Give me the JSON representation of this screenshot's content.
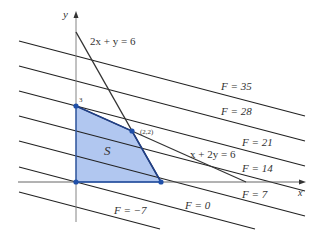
{
  "diagram": {
    "type": "linear-programming-feasible-region",
    "axes": {
      "x_label": "x",
      "y_label": "y",
      "y_intercept_label": "3"
    },
    "constraints": [
      {
        "id": "c1",
        "label": "2x + y = 6"
      },
      {
        "id": "c2",
        "label": "x + 2y = 6"
      }
    ],
    "region": {
      "label": "S",
      "vertices": [
        [
          0,
          0
        ],
        [
          0,
          3
        ],
        [
          2,
          2
        ],
        [
          3,
          0
        ]
      ],
      "fill_color": "#a9c1ee",
      "vertex_color": "#1f4fa8"
    },
    "vertex_label": "(2,2)",
    "level_lines": [
      {
        "label": "F = 35",
        "value": 35
      },
      {
        "label": "F = 28",
        "value": 28
      },
      {
        "label": "F = 21",
        "value": 21
      },
      {
        "label": "F = 14",
        "value": 14
      },
      {
        "label": "F = 7",
        "value": 7
      },
      {
        "label": "F = 0",
        "value": 0
      },
      {
        "label": "F = −7",
        "value": -7
      }
    ],
    "colors": {
      "lines": "#222222",
      "axis": "#555555"
    }
  }
}
